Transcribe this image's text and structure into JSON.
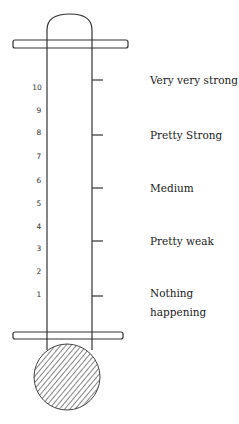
{
  "diagram": {
    "title": "",
    "type": "thermometer-scale",
    "scale_numbers": [
      "10",
      "9",
      "8",
      "7",
      "6",
      "5",
      "4",
      "3",
      "2",
      "1"
    ],
    "scale_numbers_y": [
      87,
      110,
      132,
      156,
      180,
      203,
      226,
      248,
      271,
      294
    ],
    "anchors": [
      {
        "label": "Very very strong",
        "lines": [
          "Very very strong"
        ],
        "y": 80
      },
      {
        "label": "Pretty Strong",
        "lines": [
          "Pretty Strong"
        ],
        "y": 135
      },
      {
        "label": "Medium",
        "lines": [
          "Medium"
        ],
        "y": 188
      },
      {
        "label": "Pretty weak",
        "lines": [
          "Pretty weak"
        ],
        "y": 241
      },
      {
        "label": "Nothing happening",
        "lines": [
          "Nothing",
          "happening"
        ],
        "y": 296
      }
    ],
    "colors": {
      "line": "#333333",
      "hatch": "#444444",
      "text": "#222222"
    }
  }
}
